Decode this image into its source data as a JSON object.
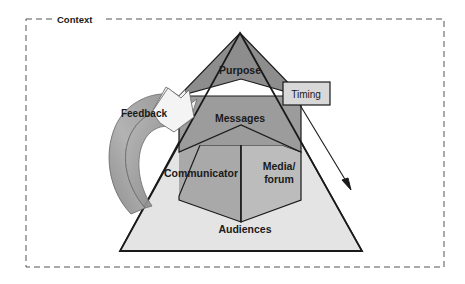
{
  "diagram": {
    "title": "Context",
    "context_label": "Context",
    "pyramid": {
      "sections": [
        {
          "id": "purpose",
          "label": "Purpose",
          "fill": "#8d8d8d"
        },
        {
          "id": "messages",
          "label": "Messages",
          "fill": "#9c9c9c"
        },
        {
          "id": "communicator",
          "label": "Communicator",
          "fill": "#a9a9a9"
        },
        {
          "id": "media_forum",
          "label_line1": "Media/",
          "label_line2": "forum",
          "label": "Media/ forum",
          "fill": "#bcbcbc"
        },
        {
          "id": "audiences",
          "label": "Audiences",
          "fill": "#e4e4e4"
        }
      ]
    },
    "annotations": [
      {
        "id": "feedback",
        "label": "Feedback",
        "shape": "curved-arrow",
        "fill": "#a5a5a5"
      },
      {
        "id": "timing",
        "label": "Timing",
        "shape": "box-with-arrow",
        "fill": "#d8d8d8"
      }
    ],
    "colors": {
      "outline": "#1a1a1a",
      "dashed_border": "#555555",
      "purpose": "#8d8d8d",
      "messages": "#9c9c9c",
      "communicator": "#a9a9a9",
      "media_forum": "#bcbcbc",
      "audiences": "#e4e4e4",
      "timing_box": "#d8d8d8",
      "feedback_arrow": "#a5a5a5",
      "background": "#ffffff"
    }
  }
}
